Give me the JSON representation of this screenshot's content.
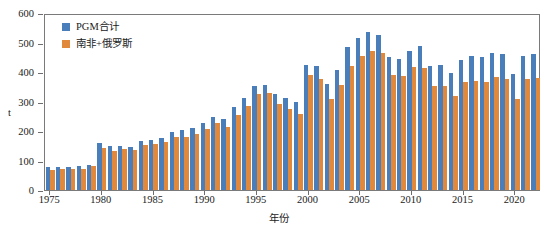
{
  "chart_data": {
    "type": "bar",
    "title": "",
    "xlabel": "年份",
    "ylabel": "t",
    "ylim": [
      0,
      600
    ],
    "ytick_labels": [
      "0",
      "100",
      "200",
      "300",
      "400",
      "500",
      "600"
    ],
    "ytick_values": [
      0,
      100,
      200,
      300,
      400,
      500,
      600
    ],
    "xtick_labels": [
      "1975",
      "1980",
      "1985",
      "1990",
      "1995",
      "2000",
      "2005",
      "2010",
      "2015",
      "2020"
    ],
    "xtick_values": [
      1975,
      1980,
      1985,
      1990,
      1995,
      2000,
      2005,
      2010,
      2015,
      2020
    ],
    "grid": false,
    "legend_position": "top-left",
    "categories": [
      1975,
      1976,
      1977,
      1978,
      1979,
      1980,
      1981,
      1982,
      1983,
      1984,
      1985,
      1986,
      1987,
      1988,
      1989,
      1990,
      1991,
      1992,
      1993,
      1994,
      1995,
      1996,
      1997,
      1998,
      1999,
      2000,
      2001,
      2002,
      2003,
      2004,
      2005,
      2006,
      2007,
      2008,
      2009,
      2010,
      2011,
      2012,
      2013,
      2014,
      2015,
      2016,
      2017,
      2018,
      2019,
      2020,
      2021,
      2022
    ],
    "series": [
      {
        "name": "PGM合计",
        "color": "#4a7ebb",
        "values": [
          78,
          77,
          77,
          80,
          85,
          158,
          148,
          150,
          147,
          165,
          170,
          178,
          195,
          205,
          210,
          228,
          248,
          240,
          280,
          312,
          353,
          357,
          324,
          313,
          298,
          424,
          419,
          361,
          408,
          486,
          517,
          535,
          526,
          451,
          444,
          472,
          489,
          419,
          425,
          396,
          441,
          453,
          450,
          465,
          462,
          393,
          455,
          462
        ]
      },
      {
        "name": "南非+俄罗斯",
        "color": "#e0883c",
        "values": [
          68,
          70,
          70,
          72,
          80,
          144,
          131,
          140,
          136,
          152,
          156,
          164,
          181,
          181,
          189,
          207,
          226,
          214,
          253,
          285,
          326,
          330,
          292,
          274,
          258,
          389,
          378,
          308,
          355,
          421,
          455,
          470,
          463,
          390,
          388,
          417,
          415,
          352,
          351,
          320,
          366,
          371,
          366,
          382,
          378,
          307,
          375,
          381
        ]
      }
    ]
  },
  "legend": {
    "items": [
      {
        "label": "PGM合计",
        "color": "#4a7ebb"
      },
      {
        "label": "南非+俄罗斯",
        "color": "#e0883c"
      }
    ]
  },
  "axes": {
    "y_title": "t",
    "x_title": "年份"
  }
}
